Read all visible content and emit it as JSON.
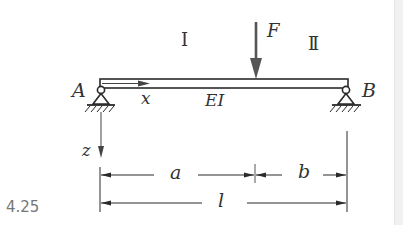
{
  "figure": {
    "number": "4.25",
    "labels": {
      "region_1": "I",
      "region_2": "II",
      "force": "F",
      "support_a": "A",
      "support_b": "B",
      "x_axis": "x",
      "z_axis": "z",
      "stiffness": "EI",
      "dim_a": "a",
      "dim_b": "b",
      "dim_l": "l"
    },
    "colors": {
      "line": "#2a2a2a",
      "force_arrow": "#555555",
      "figure_number": "#777777",
      "background": "#ffffff"
    }
  }
}
